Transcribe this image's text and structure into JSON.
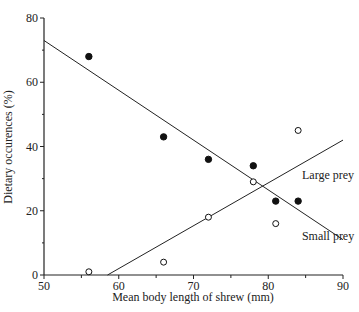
{
  "chart_data": {
    "type": "scatter",
    "title": "",
    "xlabel": "Mean body length of shrew (mm)",
    "ylabel": "Dietary occurences (%)",
    "xlim": [
      50,
      90
    ],
    "ylim": [
      0,
      80
    ],
    "x_ticks": [
      50,
      60,
      70,
      80,
      90
    ],
    "y_ticks": [
      0,
      20,
      40,
      60,
      80
    ],
    "grid": false,
    "legend": "none (lines labeled inline)",
    "series": [
      {
        "name": "Large prey",
        "marker": "filled-circle",
        "points": [
          [
            56,
            68
          ],
          [
            66,
            43
          ],
          [
            72,
            36
          ],
          [
            78,
            34
          ],
          [
            81,
            23
          ],
          [
            84,
            23
          ]
        ],
        "trend_line": {
          "from": [
            50,
            73
          ],
          "to": [
            90,
            11
          ]
        }
      },
      {
        "name": "Small prey",
        "marker": "open-circle",
        "points": [
          [
            56,
            1
          ],
          [
            66,
            4
          ],
          [
            72,
            18
          ],
          [
            78,
            29
          ],
          [
            81,
            16
          ],
          [
            84,
            45
          ]
        ],
        "trend_line": {
          "from": [
            58.5,
            0
          ],
          "to": [
            90,
            42
          ]
        }
      }
    ],
    "annotations": [
      {
        "text": "Large prey",
        "x": 88,
        "y": 30
      },
      {
        "text": "Small prey",
        "x": 88,
        "y": 11
      }
    ]
  }
}
